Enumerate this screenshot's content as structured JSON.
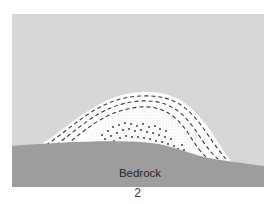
{
  "diagram": {
    "labels": {
      "bedrock": "Bedrock"
    },
    "figure_number": "2",
    "colors": {
      "sky": "#d7d7d7",
      "mound": "#ffffff",
      "bedrock": "#9d9d9d",
      "dash": "#3a3a3a",
      "dots": "#2a2a2a",
      "stipple": "#b5b5b5",
      "text": "#222222"
    },
    "elements": [
      {
        "name": "background-panel",
        "description": "light gray field"
      },
      {
        "name": "sediment-mound",
        "description": "white dome-shaped deposit with layered dashed bands"
      },
      {
        "name": "coarse-core",
        "description": "stippled core with scattered dark clasts"
      },
      {
        "name": "bedrock",
        "description": "darker gray bedrock surface beneath mound"
      }
    ]
  }
}
